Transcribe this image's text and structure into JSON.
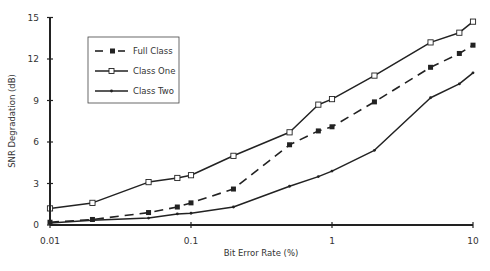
{
  "chart_data": {
    "type": "line",
    "title": "",
    "xlabel": "Bit Error Rate (%)",
    "ylabel": "SNR Degradation (dB)",
    "xscale": "log",
    "xlim": [
      0.01,
      10
    ],
    "ylim": [
      0,
      15
    ],
    "xticks": [
      0.01,
      0.1,
      1,
      10
    ],
    "xtick_labels": [
      "0.01",
      "0.1",
      "1",
      "10"
    ],
    "yticks": [
      0,
      3,
      6,
      9,
      12,
      15
    ],
    "ytick_labels": [
      "0",
      "3",
      "6",
      "9",
      "12",
      "15"
    ],
    "grid": false,
    "legend_position": "upper-left (inside plot)",
    "x": [
      0.01,
      0.02,
      0.05,
      0.08,
      0.1,
      0.2,
      0.5,
      0.8,
      1,
      2,
      5,
      8,
      10
    ],
    "series": [
      {
        "name": "Full Class",
        "line_style": "dashed",
        "marker": "filled-square",
        "values": [
          0.2,
          0.4,
          0.9,
          1.3,
          1.6,
          2.6,
          5.8,
          6.8,
          7.1,
          8.9,
          11.4,
          12.4,
          13.0
        ]
      },
      {
        "name": "Class One",
        "line_style": "solid",
        "marker": "open-square",
        "values": [
          1.2,
          1.6,
          3.1,
          3.4,
          3.6,
          5.0,
          6.7,
          8.7,
          9.1,
          10.8,
          13.2,
          13.9,
          14.7
        ]
      },
      {
        "name": "Class Two",
        "line_style": "solid",
        "marker": "small-dot",
        "values": [
          0.15,
          0.35,
          0.5,
          0.8,
          0.85,
          1.3,
          2.8,
          3.5,
          3.9,
          5.4,
          9.2,
          10.2,
          11.0
        ]
      }
    ]
  },
  "legend": {
    "items": [
      {
        "label": "Full Class"
      },
      {
        "label": "Class One"
      },
      {
        "label": "Class Two"
      }
    ]
  },
  "colors": {
    "line": "#222222",
    "axis": "#222222",
    "background": "#ffffff"
  }
}
